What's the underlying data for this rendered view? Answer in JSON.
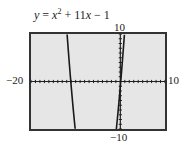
{
  "title": {
    "lhs": "y",
    "eq": " = ",
    "x1": "x",
    "exp": "2",
    "rest1": " + 11",
    "x2": "x",
    "rest2": " − 1"
  },
  "labels": {
    "ymax": "10",
    "ymin": "−10",
    "xmin": "−20",
    "xmax": "10"
  },
  "colors": {
    "screen_bg": "#e6e6e6",
    "frame": "#333333",
    "curve": "#1a1a1a",
    "axis": "#222222"
  },
  "chart_data": {
    "type": "line",
    "function": "x^2 + 11x - 1",
    "xlabel": "",
    "ylabel": "",
    "xlim": [
      -20,
      10
    ],
    "ylim": [
      -10,
      10
    ],
    "xscale": 1,
    "yscale": 1,
    "grid": false,
    "tick_labels": {
      "xmin": "-20",
      "xmax": "10",
      "ymin": "-10",
      "ymax": "10"
    },
    "series": [
      {
        "name": "y = x^2 + 11x - 1",
        "x": [
          -11.92,
          -11.5,
          -11.09,
          -10.5,
          -10.11,
          -0.89,
          -0.5,
          0.0,
          0.09,
          0.5,
          0.92
        ],
        "y": [
          10,
          5.75,
          0,
          -6.25,
          -10,
          -10,
          -6.25,
          -1,
          0,
          4.75,
          10
        ]
      }
    ],
    "annotations": [
      "vertex (-5.5, -31.25) lies below visible window"
    ]
  }
}
